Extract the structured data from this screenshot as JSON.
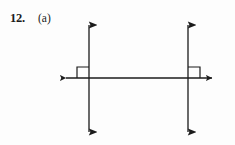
{
  "page": {
    "background_color": "#fdfdfd",
    "ink_color": "#1b1b1b",
    "width": 235,
    "height": 145
  },
  "label": {
    "problem_number": "12.",
    "part_letter": "(a)"
  },
  "figure": {
    "horizontal_line": {
      "name": "horizontal-transversal",
      "y": 78,
      "x_start": 60,
      "x_end": 218,
      "arrow_start": true,
      "arrow_end": true
    },
    "vertical_lines": [
      {
        "name": "left-vertical-line",
        "x": 89,
        "y_start": 17,
        "y_end": 140,
        "arrow_start": true,
        "arrow_end": true
      },
      {
        "name": "right-vertical-line",
        "x": 188,
        "y_start": 17,
        "y_end": 140,
        "arrow_start": true,
        "arrow_end": true
      }
    ],
    "right_angle_marks": [
      {
        "name": "right-angle-mark-left",
        "x": 77,
        "y": 67,
        "width": 12,
        "height": 11,
        "quadrant": "upper-left"
      },
      {
        "name": "right-angle-mark-right",
        "x": 188,
        "y": 67,
        "width": 12,
        "height": 11,
        "quadrant": "upper-right"
      }
    ],
    "stroke_width": 1.3,
    "arrow_size": 5.5
  }
}
